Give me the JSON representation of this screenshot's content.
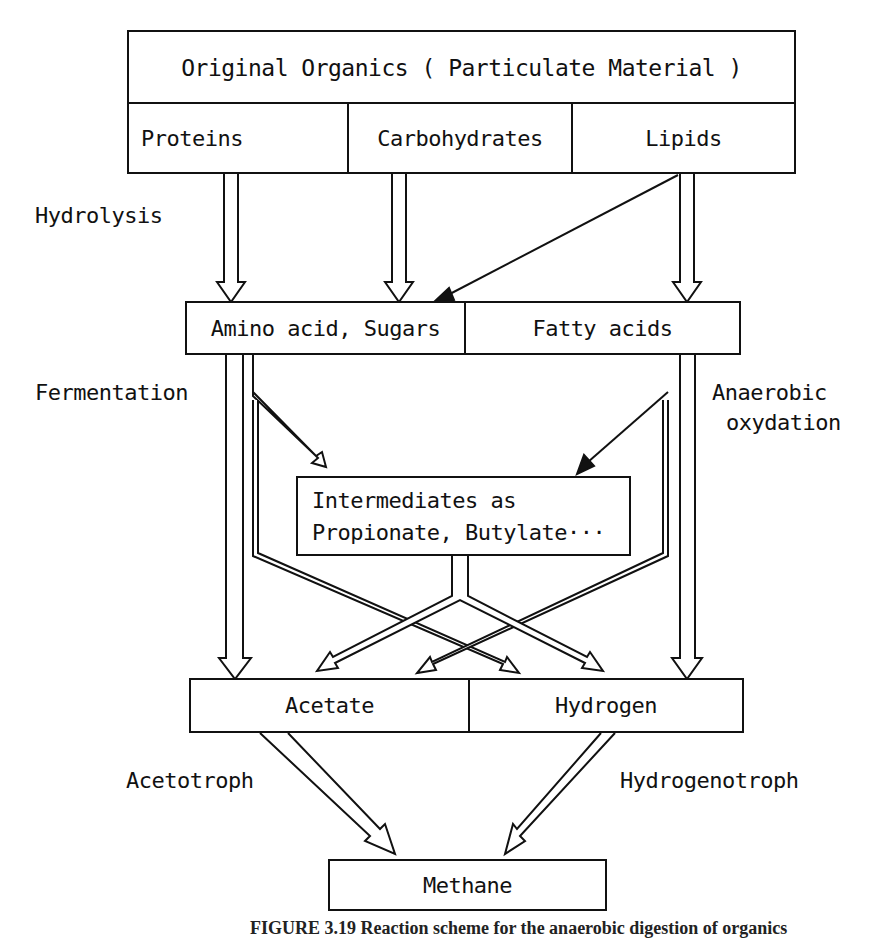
{
  "diagram": {
    "title_box": "Original Organics ( Particulate Material )",
    "sources": [
      {
        "label": "Proteins"
      },
      {
        "label": "Carbohydrates"
      },
      {
        "label": "Lipids"
      }
    ],
    "hydrolysis_products": [
      {
        "label": "Amino acid, Sugars"
      },
      {
        "label": "Fatty acids"
      }
    ],
    "intermediates": {
      "line1": "Intermediates as",
      "line2": "Propionate, Butylate···"
    },
    "methanogenic_substrates": [
      {
        "label": "Acetate"
      },
      {
        "label": "Hydrogen"
      }
    ],
    "final_product": "Methane",
    "process_labels": {
      "hydrolysis": "Hydrolysis",
      "fermentation": "Fermentation",
      "anaerobic_oxidation_line1": "Anaerobic",
      "anaerobic_oxidation_line2": "oxydation",
      "acetotroph": "Acetotroph",
      "hydrogenotroph": "Hydrogenotroph"
    },
    "caption": "FIGURE 3.19 Reaction scheme for the anaerobic digestion of organics"
  }
}
